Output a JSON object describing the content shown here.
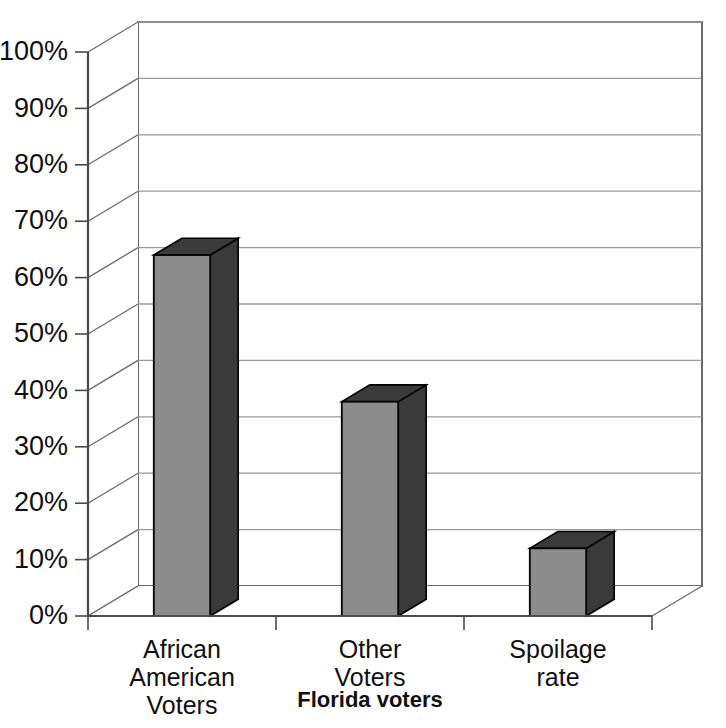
{
  "chart_data": {
    "type": "bar",
    "title": "",
    "subtitle": "",
    "xlabel": "Florida voters",
    "ylabel": "",
    "categories": [
      "African American Voters",
      "Other Voters",
      "Spoilage rate"
    ],
    "category_lines": [
      [
        "African",
        "American",
        "Voters"
      ],
      [
        "Other",
        "Voters"
      ],
      [
        "Spoilage",
        "rate"
      ]
    ],
    "values": [
      64,
      38,
      12
    ],
    "value_labels": [
      "64%",
      "38%",
      "12%"
    ],
    "ylim": [
      0,
      100
    ],
    "y_tick_labels": [
      "0%",
      "10%",
      "20%",
      "30%",
      "40%",
      "50%",
      "60%",
      "70%",
      "80%",
      "90%",
      "100%"
    ],
    "y_tick_values": [
      0,
      10,
      20,
      30,
      40,
      50,
      60,
      70,
      80,
      90,
      100
    ],
    "grid": true,
    "grid_axis": "y",
    "legend": false,
    "legend_position": "none",
    "three_d": true,
    "series": [
      {
        "name": "Florida voters",
        "values": [
          64,
          38,
          12
        ]
      }
    ],
    "colors": {
      "bar_front": "#8c8c8c",
      "bar_side": "#3a3a3a",
      "bar_top": "#3a3a3a",
      "bar_outline": "#000000",
      "grid": "#9a9a9a",
      "axis": "#4a4a4a",
      "text": "#101010",
      "background": "#ffffff"
    }
  }
}
